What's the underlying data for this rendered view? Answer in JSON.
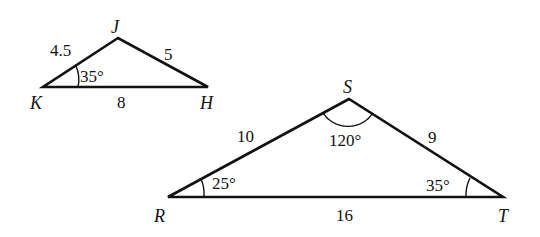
{
  "triangles": [
    {
      "name": "JKH",
      "vertices": {
        "J": {
          "label": "J",
          "x": 118,
          "y": 38
        },
        "K": {
          "label": "K",
          "x": 43,
          "y": 87
        },
        "H": {
          "label": "H",
          "x": 208,
          "y": 87
        }
      },
      "sides": {
        "KJ": "4.5",
        "JH": "5",
        "KH": "8"
      },
      "angles": {
        "K": "35°"
      }
    },
    {
      "name": "RST",
      "vertices": {
        "S": {
          "label": "S",
          "x": 349,
          "y": 99
        },
        "R": {
          "label": "R",
          "x": 168,
          "y": 197
        },
        "T": {
          "label": "T",
          "x": 503,
          "y": 197
        }
      },
      "sides": {
        "RS": "10",
        "ST": "9",
        "RT": "16"
      },
      "angles": {
        "S": "120°",
        "R": "25°",
        "T": "35°"
      }
    }
  ]
}
